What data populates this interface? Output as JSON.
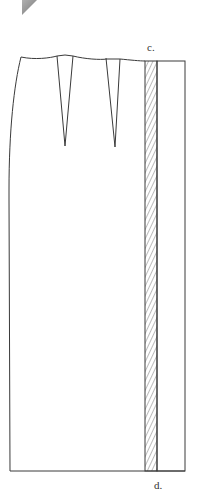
{
  "diagram": {
    "type": "sewing-pattern",
    "labels": {
      "top_point": "c.",
      "bottom_point": "d."
    },
    "features": {
      "darts": 2,
      "hatched_strip": "seam allowance / extension between c. and d.",
      "corner_fold": "grey triangle page-curl at top-left"
    },
    "colors": {
      "line": "#3a3a3a",
      "hatch": "#555555",
      "fold": "#9a9a9a",
      "background": "#ffffff"
    }
  }
}
